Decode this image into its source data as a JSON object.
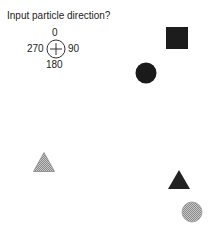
{
  "prompt": "Input particle direction?",
  "dial": {
    "icon": "crosshair-circle-icon",
    "labels": {
      "top": "0",
      "right": "90",
      "bottom": "180",
      "left": "270"
    }
  },
  "shapes": [
    {
      "name": "black-square",
      "type": "square",
      "fill": "#1c1c1c"
    },
    {
      "name": "black-circle",
      "type": "circle",
      "fill": "#1a1a1a"
    },
    {
      "name": "hatched-triangle",
      "type": "triangle",
      "fill": "hatched-gray"
    },
    {
      "name": "black-triangle",
      "type": "triangle",
      "fill": "#222222"
    },
    {
      "name": "hatched-circle",
      "type": "circle",
      "fill": "hatched-gray"
    }
  ]
}
